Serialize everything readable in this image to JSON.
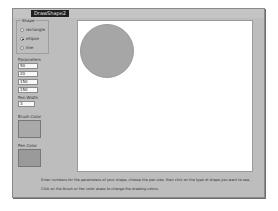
{
  "window": {
    "title": "DrawShape2"
  },
  "shape_group": {
    "label": "Shape",
    "options": [
      {
        "label": "rectangle",
        "selected": false
      },
      {
        "label": "ellipse",
        "selected": true
      },
      {
        "label": "line",
        "selected": false
      }
    ]
  },
  "parameters": {
    "label": "Parameters",
    "values": [
      "50",
      "20",
      "150",
      "150"
    ]
  },
  "pen_width": {
    "label": "Pen Width",
    "value": "3"
  },
  "brush_color": {
    "label": "Brush Color",
    "color": "#a9a9a9"
  },
  "pen_color": {
    "label": "Pen Color",
    "color": "#9a9a9a"
  },
  "canvas": {
    "background": "#ffffff",
    "shape": {
      "type": "ellipse",
      "fill": "#a6a6a6",
      "stroke": "#9a9a9a"
    }
  },
  "instructions": {
    "line1": "Enter numbers for the parameters of your shape, choose the pen size, then click on the type of shape you want to see.",
    "line2": "Click on the Brush or Pen color areas to change the drawing colors."
  }
}
